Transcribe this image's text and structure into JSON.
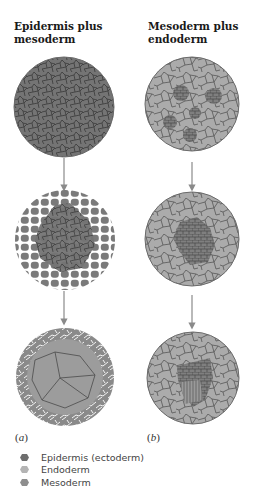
{
  "columns": [
    {
      "title_line1": "Epidermis plus",
      "title_line2": "mesoderm",
      "part_label": "a",
      "stages": [
        "epidermis-dense",
        "epidermis-spreading",
        "epidermis-envelope"
      ]
    },
    {
      "title_line1": "Mesoderm plus",
      "title_line2": "endoderm",
      "part_label": "b",
      "stages": [
        "mesoderm-clusters",
        "mesoderm-aggregate",
        "mesoderm-tube"
      ]
    }
  ],
  "legend": [
    {
      "label": "Epidermis (ectoderm)",
      "icon": "dark-cell-icon",
      "color": "#6e6e6e"
    },
    {
      "label": "Endoderm",
      "icon": "light-cell-icon",
      "color": "#b4b4b4"
    },
    {
      "label": "Mesoderm",
      "icon": "mid-cell-icon",
      "color": "#8e8e8e"
    }
  ],
  "colors": {
    "epidermis": "#6e6e6e",
    "endoderm": "#b4b4b4",
    "mesoderm": "#8e8e8e",
    "cell_border": "#4a4a4a",
    "arrow": "#8a8a8a"
  }
}
